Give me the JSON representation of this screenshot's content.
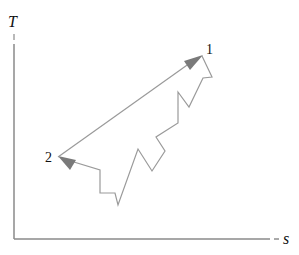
{
  "diagram": {
    "type": "T-s diagram",
    "axes": {
      "y_label": "T",
      "x_label": "s"
    },
    "states": [
      {
        "label": "1",
        "x": 202,
        "y": 56
      },
      {
        "label": "2",
        "x": 58,
        "y": 157
      }
    ],
    "colors": {
      "axis": "#8a8a8a",
      "path": "#9a9a9a",
      "arrow": "#7a7a7a",
      "text": "#111111"
    },
    "paths": {
      "reversible_2_to_1": "58,157 202,56",
      "irreversible_1_to_2": "202,56 212,77 203,78 189,107 178,92 178,123 156,137 165,151 152,171 138,149 118,205 115,193 100,193 100,170 58,157"
    }
  }
}
